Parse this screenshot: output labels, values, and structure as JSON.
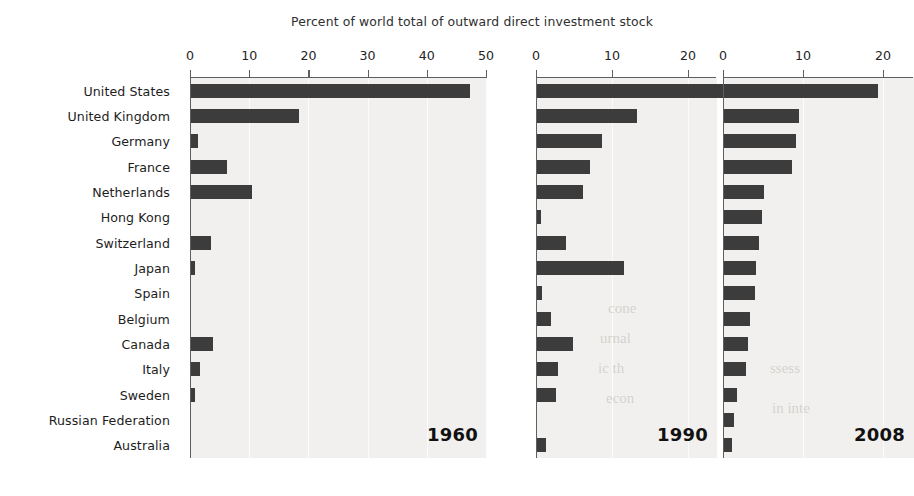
{
  "chart_title": "Percent of world total of outward direct investment stock",
  "countries": [
    "United States",
    "United Kingdom",
    "Germany",
    "France",
    "Netherlands",
    "Hong Kong",
    "Switzerland",
    "Japan",
    "Spain",
    "Belgium",
    "Canada",
    "Italy",
    "Sweden",
    "Russian Federation",
    "Australia"
  ],
  "panels": [
    {
      "year": "1960",
      "ticks": [
        "0",
        "10",
        "20",
        "30",
        "40",
        "50"
      ],
      "tick_values": [
        0,
        10,
        20,
        30,
        40,
        50
      ]
    },
    {
      "year": "1990",
      "ticks": [
        "0",
        "10",
        "20"
      ],
      "tick_values": [
        0,
        10,
        20
      ]
    },
    {
      "year": "2008",
      "ticks": [
        "0",
        "10",
        "20"
      ],
      "tick_values": [
        0,
        10,
        20
      ]
    }
  ],
  "ghost_text": [
    {
      "text": "cone",
      "x": 608,
      "y": 300
    },
    {
      "text": "urnal",
      "x": 600,
      "y": 330
    },
    {
      "text": "ic th",
      "x": 598,
      "y": 360
    },
    {
      "text": "econ",
      "x": 606,
      "y": 390
    },
    {
      "text": "ssess",
      "x": 770,
      "y": 360
    },
    {
      "text": "in inte",
      "x": 772,
      "y": 400
    }
  ],
  "colors": {
    "bar": "#3c3c3c",
    "panel_background": "#f1f0ee",
    "axis": "#5f5f5f",
    "gridline": "#fbfbfa",
    "text": "#1d1d1d",
    "page_background": "#ffffff"
  },
  "chart_data": {
    "type": "bar",
    "orientation": "horizontal",
    "title": "Percent of world total of outward direct investment stock",
    "xlabel": "Percent of world total of outward direct investment stock",
    "ylabel": "",
    "grid": true,
    "legend": "none",
    "categories": [
      "United States",
      "United Kingdom",
      "Germany",
      "France",
      "Netherlands",
      "Hong Kong",
      "Switzerland",
      "Japan",
      "Spain",
      "Belgium",
      "Canada",
      "Italy",
      "Sweden",
      "Russian Federation",
      "Australia"
    ],
    "panels": [
      {
        "name": "1960",
        "xlim": [
          0,
          50
        ],
        "xticks": [
          0,
          10,
          20,
          30,
          40,
          50
        ],
        "values": [
          47.1,
          18.3,
          1.2,
          6.1,
          10.3,
          0.0,
          3.4,
          0.7,
          0.0,
          0.0,
          3.7,
          1.6,
          0.6,
          0.0,
          0.0
        ]
      },
      {
        "name": "1990",
        "xlim": [
          0,
          25
        ],
        "xticks": [
          0,
          10,
          20
        ],
        "values": [
          24.6,
          13.2,
          8.6,
          7.0,
          6.0,
          0.5,
          3.8,
          11.5,
          0.6,
          1.8,
          4.7,
          2.8,
          2.5,
          0.0,
          1.2
        ]
      },
      {
        "name": "2008",
        "xlim": [
          0,
          20
        ],
        "xticks": [
          0,
          10,
          20
        ],
        "values": [
          19.3,
          9.4,
          9.0,
          8.5,
          5.0,
          4.7,
          4.4,
          4.0,
          3.9,
          3.3,
          3.0,
          2.7,
          1.6,
          1.2,
          1.0
        ]
      }
    ]
  }
}
